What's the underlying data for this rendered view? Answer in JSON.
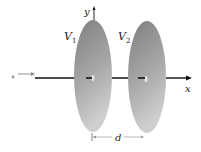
{
  "diagram": {
    "type": "parallel-disk-electrodes",
    "labels": {
      "y_axis": "y",
      "x_axis": "x",
      "disk1": "V",
      "disk1_sub": "1",
      "disk2": "V",
      "disk2_sub": "2",
      "separation": "d",
      "particle": "•"
    },
    "colors": {
      "disk_dark": "#8a8a8a",
      "disk_light": "#c8c8c8",
      "axis": "#111111",
      "arrow_gray": "#888888"
    }
  }
}
